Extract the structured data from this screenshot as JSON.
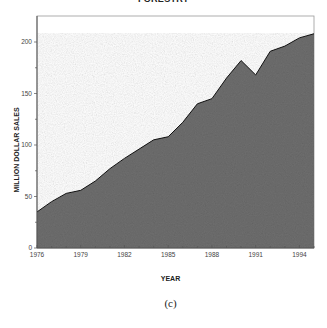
{
  "title": "FORESTRY",
  "ylabel": "MILLION DOLLAR SALES",
  "xlabel": "YEAR",
  "caption": "(c)",
  "colors": {
    "fill": "#6e6e6e",
    "line": "#111111",
    "axis": "#555555"
  },
  "chart_data": {
    "type": "area",
    "title": "FORESTRY",
    "xlabel": "YEAR",
    "ylabel": "MILLION DOLLAR SALES",
    "x": [
      1976,
      1977,
      1978,
      1979,
      1980,
      1981,
      1982,
      1983,
      1984,
      1985,
      1986,
      1987,
      1988,
      1989,
      1990,
      1991,
      1992,
      1993,
      1994,
      1995
    ],
    "values": [
      35,
      45,
      53,
      56,
      65,
      77,
      87,
      96,
      105,
      108,
      122,
      140,
      145,
      165,
      182,
      168,
      191,
      196,
      204,
      208
    ],
    "xticks": [
      "1976",
      "1979",
      "1982",
      "1985",
      "1988",
      "1991",
      "1994"
    ],
    "yticks": [
      "0",
      "50",
      "100",
      "150",
      "200"
    ],
    "ylim": [
      0,
      225
    ],
    "xlim": [
      1976,
      1995
    ],
    "grid": false,
    "legend": null
  }
}
